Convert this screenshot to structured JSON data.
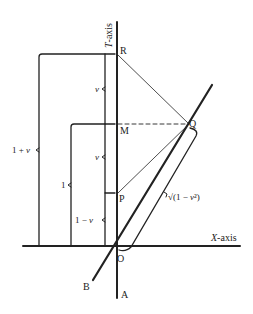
{
  "diagram": {
    "axes": {
      "t_axis_label": "T-axis",
      "x_axis_label": "X-axis"
    },
    "points": {
      "R": "R",
      "M": "M",
      "Q": "Q",
      "P": "P",
      "O": "O",
      "A": "A",
      "B": "B"
    },
    "brackets": {
      "one_plus_v": "1 + v",
      "one": "1",
      "v_upper": "v",
      "v_lower": "v",
      "one_minus_v": "1 − v",
      "sqrt_label": "√(1 − v²)"
    },
    "colors": {
      "ink": "#222222",
      "background": "#ffffff"
    }
  }
}
